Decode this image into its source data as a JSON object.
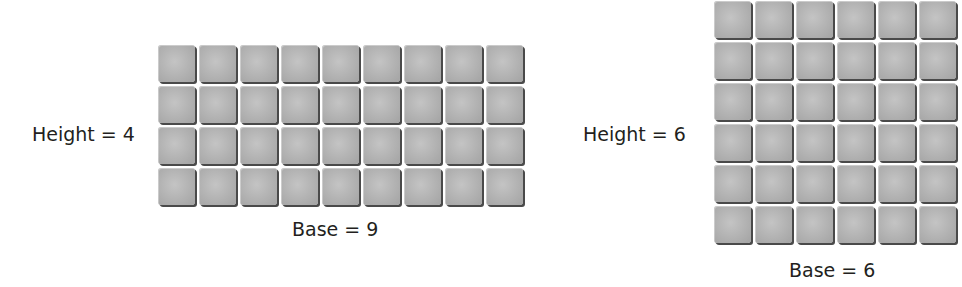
{
  "figures": [
    {
      "id": "rectangle-4x9",
      "height_label": "Height = 4",
      "base_label": "Base = 9",
      "rows": 4,
      "cols": 9
    },
    {
      "id": "square-6x6",
      "height_label": "Height = 6",
      "base_label": "Base = 6",
      "rows": 6,
      "cols": 6
    }
  ],
  "colors": {
    "tile_fill": "#b5b5b5",
    "tile_shadow": "#4a4a4a",
    "text": "#231f20",
    "background": "#ffffff"
  }
}
